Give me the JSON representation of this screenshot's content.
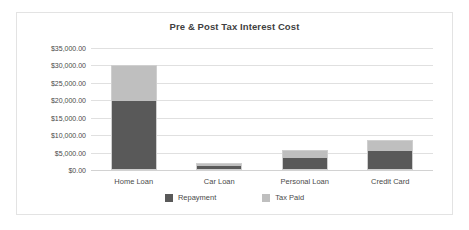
{
  "chart_data": {
    "type": "bar",
    "subtype": "stacked",
    "title": "Pre & Post Tax Interest Cost",
    "xlabel": "",
    "ylabel": "",
    "categories": [
      "Home Loan",
      "Car Loan",
      "Personal Loan",
      "Credit Card"
    ],
    "series": [
      {
        "name": "Repayment",
        "color": "#595959",
        "values": [
          20000,
          1400,
          3400,
          5450
        ]
      },
      {
        "name": "Tax Paid",
        "color": "#bfbfbf",
        "values": [
          10200,
          600,
          2400,
          3150
        ]
      }
    ],
    "ylim": [
      0,
      35000
    ],
    "ytick_values": [
      0,
      5000,
      10000,
      15000,
      20000,
      25000,
      30000,
      35000
    ],
    "ytick_labels": [
      "$0.00",
      "$5,000.00",
      "$10,000.00",
      "$15,000.00",
      "$20,000.00",
      "$25,000.00",
      "$30,000.00",
      "$35,000.00"
    ],
    "grid": true,
    "legend_position": "bottom",
    "totals": [
      30200,
      2000,
      5800,
      8600
    ]
  },
  "colors": {
    "repayment": "#595959",
    "tax_paid": "#bfbfbf",
    "gridline": "#e0e0e0",
    "frame_border": "#e3e3e3",
    "text": "#4a4a4a",
    "title": "#3f3f3f"
  }
}
